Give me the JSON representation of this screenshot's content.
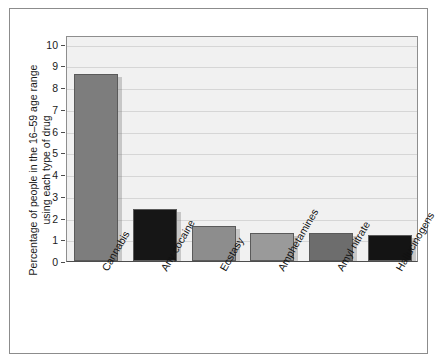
{
  "chart_data": {
    "type": "bar",
    "title": "",
    "xlabel": "",
    "ylabel": "Percentage of people in the 16–59 age range using each type of drug",
    "categories": [
      "Cannabis",
      "Any cocaine",
      "Ecstasy",
      "Amphetamines",
      "Amyl nitrate",
      "Hallucinogens"
    ],
    "values": [
      8.6,
      2.4,
      1.6,
      1.3,
      1.3,
      1.2
    ],
    "ylim": [
      0,
      10.4
    ],
    "yticks": [
      "0",
      "1",
      "2",
      "3",
      "4",
      "5",
      "6",
      "7",
      "8",
      "9",
      "10"
    ],
    "ytick_values": [
      0,
      1,
      2,
      3,
      4,
      5,
      6,
      7,
      8,
      9,
      10
    ],
    "grid": true,
    "legend": "none",
    "bar_colors": [
      "#7d7d7d",
      "#161616",
      "#8d8d8d",
      "#9a9a9a",
      "#6d6d6d",
      "#141414"
    ],
    "plot_background": "#f1f1f1",
    "gridline_color": "#d6d6d6",
    "axis_color": "#4d4d4d",
    "figure_background": "#ffffff"
  }
}
